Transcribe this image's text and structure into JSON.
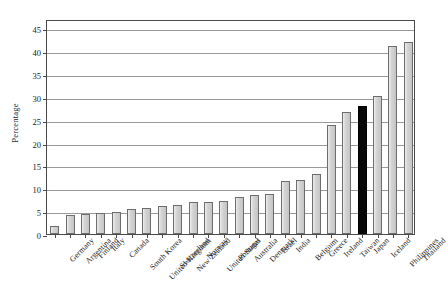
{
  "chart_data": {
    "type": "bar",
    "title": "",
    "subtitle": "",
    "xlabel": "",
    "ylabel": "Percentage",
    "ylim": [
      0,
      47
    ],
    "yticks": [
      0,
      5,
      10,
      15,
      20,
      25,
      30,
      35,
      40,
      45
    ],
    "grid": "horizontal",
    "legend": "none",
    "categories": [
      "Germany",
      "Argentina",
      "Finland",
      "Italy",
      "Canada",
      "South Korea",
      "United Kingdom",
      "Switzerland",
      "New Zealand",
      "Norway",
      "United States",
      "Portugal",
      "Australia",
      "Denmark",
      "Israel",
      "India",
      "Belgium",
      "Greece",
      "Ireland",
      "Taiwan",
      "Japan",
      "Iceland",
      "Philippines",
      "Thailand"
    ],
    "values": [
      1.7,
      4.2,
      4.3,
      4.7,
      4.9,
      5.4,
      5.7,
      6.2,
      6.4,
      6.9,
      7.1,
      7.3,
      8.0,
      8.5,
      8.7,
      11.6,
      11.8,
      13.2,
      23.8,
      26.7,
      28.0,
      30.2,
      41.2,
      42.0
    ],
    "highlight_category": "Japan",
    "highlight_index": 20,
    "bar_colors": {
      "default_fill": "#c9c9c9",
      "default_stroke": "#6d6d6d",
      "highlight_fill": "#070707",
      "highlight_stroke": "#000000"
    },
    "axis_color": "#4a4a4a",
    "gridline_color": "#9a9a9a",
    "background": "#ffffff"
  }
}
